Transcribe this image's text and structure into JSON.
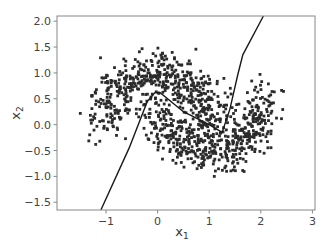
{
  "chart_data": {
    "type": "scatter",
    "title": "",
    "xlabel": "x1",
    "ylabel": "x2",
    "xlabel_main": "x",
    "xlabel_sub": "1",
    "ylabel_main": "x",
    "ylabel_sub": "2",
    "xlim": [
      -1.95,
      3.05
    ],
    "ylim": [
      -1.65,
      2.1
    ],
    "xticks": [
      -1,
      0,
      1,
      2,
      3
    ],
    "xtick_labels": [
      "−1",
      "0",
      "1",
      "2",
      "3"
    ],
    "yticks": [
      -1.5,
      -1.0,
      -0.5,
      0.0,
      0.5,
      1.0,
      1.5,
      2.0
    ],
    "ytick_labels": [
      "−1.5",
      "−1.0",
      "−0.5",
      "0.0",
      "0.5",
      "1.0",
      "1.5",
      "2.0"
    ],
    "grid": false,
    "legend": null,
    "marker_color": "#2b2b2b",
    "series": [
      {
        "name": "moon_upper",
        "generator": "moon",
        "n": 520,
        "cx": 0.0,
        "cy": 0.0,
        "flip": false,
        "noise": 0.22,
        "seed": 7
      },
      {
        "name": "moon_lower",
        "generator": "moon",
        "n": 520,
        "cx": 1.0,
        "cy": 0.5,
        "flip": true,
        "noise": 0.22,
        "seed": 13
      }
    ],
    "decision_boundary": {
      "x": [
        -1.1,
        -0.55,
        -0.2,
        -0.05,
        0.05,
        0.5,
        1.0,
        1.25,
        1.4,
        1.55,
        1.65,
        2.05
      ],
      "y": [
        -1.65,
        -0.45,
        0.45,
        0.62,
        0.62,
        0.25,
        0.0,
        -0.15,
        0.3,
        0.95,
        1.35,
        2.1
      ]
    }
  }
}
